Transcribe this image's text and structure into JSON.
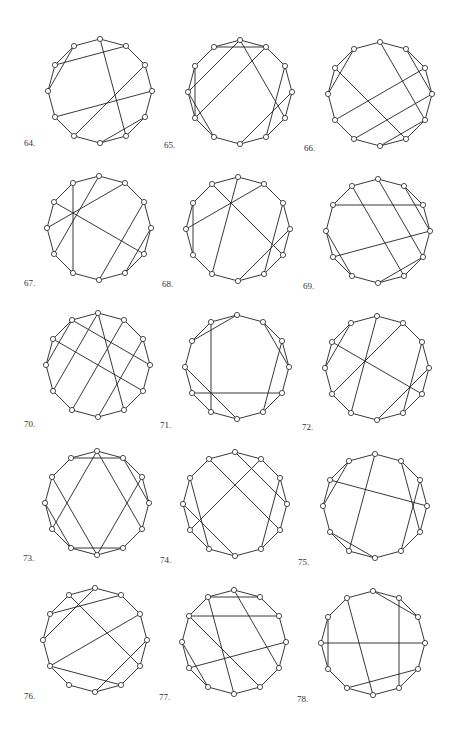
{
  "page": {
    "background": "#ffffff",
    "stroke_color": "#222222",
    "vertex_radius": 2.6,
    "graph_radius": 52,
    "vertices_per_graph": 12
  },
  "graphs": [
    {
      "label": "64.",
      "cx": 100,
      "cy": 91,
      "lx": 24,
      "ly": 138,
      "chords": [
        [
          0,
          5
        ],
        [
          1,
          10
        ],
        [
          2,
          7
        ],
        [
          3,
          8
        ],
        [
          11,
          9
        ],
        [
          4,
          6
        ]
      ]
    },
    {
      "label": "65.",
      "cx": 240,
      "cy": 92,
      "lx": 164,
      "ly": 140,
      "chords": [
        [
          11,
          1
        ],
        [
          0,
          9
        ],
        [
          1,
          8
        ],
        [
          0,
          4
        ],
        [
          3,
          6
        ],
        [
          10,
          8
        ],
        [
          9,
          7
        ],
        [
          2,
          5
        ]
      ]
    },
    {
      "label": "66.",
      "cx": 380,
      "cy": 94,
      "lx": 304,
      "ly": 143,
      "chords": [
        [
          0,
          4
        ],
        [
          10,
          5
        ],
        [
          2,
          8
        ],
        [
          3,
          7
        ],
        [
          1,
          3
        ],
        [
          11,
          9
        ],
        [
          4,
          6
        ]
      ]
    },
    {
      "label": "67.",
      "cx": 99,
      "cy": 228,
      "lx": 24,
      "ly": 278,
      "chords": [
        [
          11,
          7
        ],
        [
          0,
          8
        ],
        [
          1,
          9
        ],
        [
          10,
          4
        ],
        [
          2,
          6
        ],
        [
          3,
          5
        ]
      ]
    },
    {
      "label": "68.",
      "cx": 238,
      "cy": 229,
      "lx": 162,
      "ly": 279,
      "chords": [
        [
          10,
          8
        ],
        [
          1,
          9
        ],
        [
          11,
          4
        ],
        [
          0,
          7
        ],
        [
          2,
          5
        ],
        [
          3,
          6
        ]
      ]
    },
    {
      "label": "69.",
      "cx": 378,
      "cy": 231,
      "lx": 303,
      "ly": 281,
      "chords": [
        [
          10,
          2
        ],
        [
          11,
          5
        ],
        [
          0,
          4
        ],
        [
          1,
          3
        ],
        [
          3,
          8
        ],
        [
          9,
          7
        ],
        [
          4,
          6
        ]
      ]
    },
    {
      "label": "70.",
      "cx": 98,
      "cy": 365,
      "lx": 24,
      "ly": 419,
      "chords": [
        [
          11,
          3
        ],
        [
          10,
          4
        ],
        [
          0,
          8
        ],
        [
          0,
          5
        ],
        [
          1,
          7
        ],
        [
          2,
          6
        ],
        [
          11,
          9
        ]
      ]
    },
    {
      "label": "71.",
      "cx": 237,
      "cy": 367,
      "lx": 160,
      "ly": 420,
      "chords": [
        [
          11,
          7
        ],
        [
          8,
          4
        ],
        [
          0,
          10
        ],
        [
          1,
          3
        ],
        [
          2,
          5
        ],
        [
          9,
          6
        ]
      ]
    },
    {
      "label": "72.",
      "cx": 377,
      "cy": 368,
      "lx": 302,
      "ly": 422,
      "chords": [
        [
          0,
          7
        ],
        [
          1,
          8
        ],
        [
          10,
          4
        ],
        [
          11,
          9
        ],
        [
          2,
          5
        ],
        [
          3,
          6
        ]
      ]
    },
    {
      "label": "73.",
      "cx": 97,
      "cy": 503,
      "lx": 23,
      "ly": 553,
      "chords": [
        [
          11,
          1
        ],
        [
          0,
          8
        ],
        [
          0,
          4
        ],
        [
          10,
          6
        ],
        [
          9,
          7
        ],
        [
          7,
          5
        ],
        [
          1,
          3
        ],
        [
          2,
          6
        ]
      ]
    },
    {
      "label": "74.",
      "cx": 235,
      "cy": 504,
      "lx": 160,
      "ly": 555,
      "chords": [
        [
          11,
          4
        ],
        [
          0,
          3
        ],
        [
          1,
          8
        ],
        [
          10,
          7
        ],
        [
          9,
          6
        ],
        [
          2,
          5
        ]
      ]
    },
    {
      "label": "75.",
      "cx": 375,
      "cy": 506,
      "lx": 298,
      "ly": 557,
      "chords": [
        [
          0,
          7
        ],
        [
          10,
          3
        ],
        [
          1,
          4
        ],
        [
          2,
          5
        ],
        [
          11,
          9
        ],
        [
          8,
          6
        ]
      ]
    },
    {
      "label": "76.",
      "cx": 95,
      "cy": 640,
      "lx": 24,
      "ly": 691,
      "chords": [
        [
          0,
          9
        ],
        [
          10,
          1
        ],
        [
          11,
          4
        ],
        [
          2,
          8
        ],
        [
          8,
          5
        ],
        [
          3,
          6
        ]
      ]
    },
    {
      "label": "77.",
      "cx": 234,
      "cy": 642,
      "lx": 159,
      "ly": 692,
      "chords": [
        [
          11,
          1
        ],
        [
          10,
          2
        ],
        [
          11,
          6
        ],
        [
          0,
          4
        ],
        [
          10,
          5
        ],
        [
          3,
          8
        ],
        [
          9,
          7
        ]
      ]
    },
    {
      "label": "78.",
      "cx": 373,
      "cy": 643,
      "lx": 297,
      "ly": 694,
      "chords": [
        [
          9,
          3
        ],
        [
          10,
          8
        ],
        [
          1,
          5
        ],
        [
          0,
          2
        ],
        [
          11,
          6
        ],
        [
          7,
          4
        ]
      ]
    }
  ]
}
